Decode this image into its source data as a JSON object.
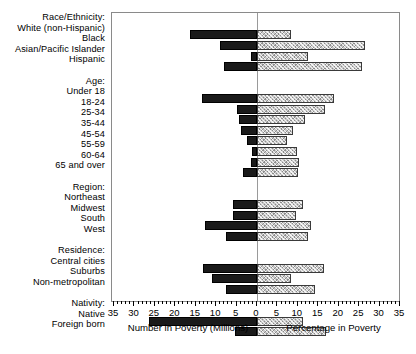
{
  "chart_data": {
    "type": "bar",
    "orientation": "horizontal-bidirectional",
    "title": "",
    "xlabel_left": "Number in Poverty (Millions)",
    "xlabel_right": "Percentage in Poverty",
    "ylabel": "",
    "xlim_left": [
      0,
      35
    ],
    "xlim_right": [
      0,
      35
    ],
    "tick_values_left": [
      35,
      30,
      25,
      20,
      15,
      10,
      5,
      0
    ],
    "tick_values_right": [
      0,
      5,
      10,
      15,
      20,
      25,
      30,
      35
    ],
    "tick_labels": [
      "35",
      "30",
      "25",
      "20",
      "15",
      "10",
      "5",
      "0",
      "5",
      "10",
      "15",
      "20",
      "25",
      "30",
      "35"
    ],
    "minor_tick_step": 1,
    "grid": false,
    "legend": null,
    "series": [
      {
        "name": "Number in Poverty (Millions)",
        "side": "left",
        "style": "solid-black"
      },
      {
        "name": "Percentage in Poverty",
        "side": "right",
        "style": "hatched-gray"
      }
    ],
    "groups": [
      {
        "header": "Race/Ethnicity:",
        "rows": [
          {
            "label": "White (non-Hispanic)",
            "number": 16.3,
            "percent": 8.2
          },
          {
            "label": "Black",
            "number": 9.1,
            "percent": 26.5
          },
          {
            "label": "Asian/Pacific Islander",
            "number": 1.4,
            "percent": 12.5
          },
          {
            "label": "Hispanic",
            "number": 8.1,
            "percent": 25.6
          }
        ]
      },
      {
        "header": "Age:",
        "rows": [
          {
            "label": "Under 18",
            "number": 13.5,
            "percent": 18.9
          },
          {
            "label": "18-24",
            "number": 4.8,
            "percent": 16.6
          },
          {
            "label": "25-34",
            "number": 4.5,
            "percent": 11.8
          },
          {
            "label": "35-44",
            "number": 4.0,
            "percent": 8.9
          },
          {
            "label": "45-54",
            "number": 2.5,
            "percent": 7.3
          },
          {
            "label": "55-59",
            "number": 1.2,
            "percent": 9.7
          },
          {
            "label": "60-64",
            "number": 1.4,
            "percent": 10.2
          },
          {
            "label": "65 and over",
            "number": 3.4,
            "percent": 10.1
          }
        ]
      },
      {
        "header": "Region:",
        "rows": [
          {
            "label": "Northeast",
            "number": 5.8,
            "percent": 11.3
          },
          {
            "label": "Midwest",
            "number": 5.9,
            "percent": 9.5
          },
          {
            "label": "South",
            "number": 12.7,
            "percent": 13.1
          },
          {
            "label": "West",
            "number": 7.7,
            "percent": 12.6
          }
        ]
      },
      {
        "header": "Residence:",
        "rows": [
          {
            "label": "Central cities",
            "number": 13.1,
            "percent": 16.4
          },
          {
            "label": "Suburbs",
            "number": 11.0,
            "percent": 8.2
          },
          {
            "label": "Non-metropolitan",
            "number": 7.5,
            "percent": 14.3
          }
        ]
      },
      {
        "header": "Nativity:",
        "rows": [
          {
            "label": "Native",
            "number": 26.4,
            "percent": 11.2
          },
          {
            "label": "Foreign born",
            "number": 5.4,
            "percent": 17.0
          }
        ]
      }
    ]
  }
}
